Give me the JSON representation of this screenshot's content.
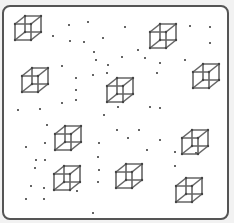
{
  "frame": {
    "border_color": "#555555",
    "background": "#ffffff"
  },
  "cube_color": "#666666",
  "dot_color": "#333333",
  "cubes": [
    {
      "x": 15,
      "y": 16
    },
    {
      "x": 150,
      "y": 24
    },
    {
      "x": 22,
      "y": 68
    },
    {
      "x": 193,
      "y": 64
    },
    {
      "x": 107,
      "y": 78
    },
    {
      "x": 55,
      "y": 126
    },
    {
      "x": 182,
      "y": 130
    },
    {
      "x": 54,
      "y": 166
    },
    {
      "x": 116,
      "y": 164
    },
    {
      "x": 176,
      "y": 178
    }
  ],
  "dots": [
    [
      69,
      25
    ],
    [
      88,
      22
    ],
    [
      53,
      36
    ],
    [
      70,
      41
    ],
    [
      84,
      42
    ],
    [
      94,
      52
    ],
    [
      103,
      38
    ],
    [
      125,
      27
    ],
    [
      138,
      50
    ],
    [
      96,
      60
    ],
    [
      108,
      65
    ],
    [
      122,
      57
    ],
    [
      107,
      73
    ],
    [
      190,
      26
    ],
    [
      210,
      27
    ],
    [
      210,
      43
    ],
    [
      145,
      58
    ],
    [
      160,
      63
    ],
    [
      185,
      60
    ],
    [
      157,
      73
    ],
    [
      62,
      66
    ],
    [
      76,
      78
    ],
    [
      76,
      90
    ],
    [
      76,
      100
    ],
    [
      18,
      110
    ],
    [
      40,
      109
    ],
    [
      47,
      125
    ],
    [
      62,
      103
    ],
    [
      45,
      143
    ],
    [
      26,
      147
    ],
    [
      36,
      160
    ],
    [
      45,
      160
    ],
    [
      35,
      168
    ],
    [
      31,
      186
    ],
    [
      44,
      188
    ],
    [
      44,
      199
    ],
    [
      26,
      199
    ],
    [
      77,
      191
    ],
    [
      93,
      213
    ],
    [
      118,
      107
    ],
    [
      150,
      107
    ],
    [
      160,
      108
    ],
    [
      117,
      130
    ],
    [
      139,
      130
    ],
    [
      128,
      138
    ],
    [
      160,
      140
    ],
    [
      147,
      150
    ],
    [
      175,
      152
    ],
    [
      196,
      153
    ],
    [
      175,
      166
    ],
    [
      99,
      143
    ],
    [
      98,
      157
    ],
    [
      99,
      170
    ],
    [
      98,
      182
    ],
    [
      104,
      115
    ],
    [
      93,
      75
    ]
  ]
}
